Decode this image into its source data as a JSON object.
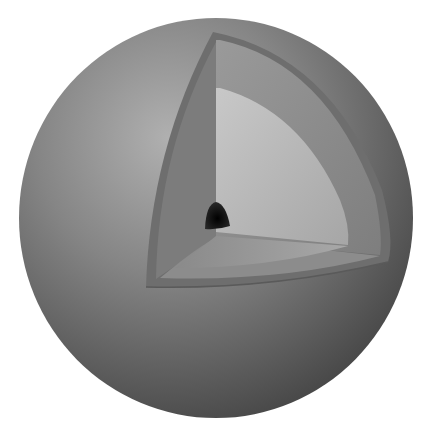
{
  "image": {
    "subject": "sphere-cutaway-illustration",
    "description": "Grey shaded sphere with a wedge cut away revealing concentric inner layers and a dark core",
    "colors": {
      "background": "#ffffff",
      "sphere_light": "#a8a8a8",
      "sphere_mid": "#7a7a7a",
      "sphere_dark": "#4a4a4a",
      "crust_rim": "#6f6f6f",
      "outer_layer": "#8e8e8e",
      "inner_layer": "#b4b4b4",
      "floor_layer": "#9a9a9a",
      "core": "#1a1a1a"
    }
  }
}
